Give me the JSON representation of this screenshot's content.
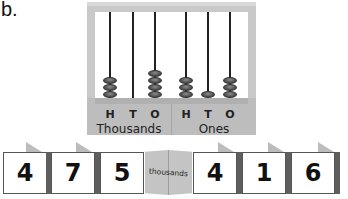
{
  "problem_label": "b.",
  "abacus": {
    "groups": [
      {
        "name": "Thousands",
        "columns": [
          {
            "letter": "H",
            "beads": 3
          },
          {
            "letter": "T",
            "beads": 0
          },
          {
            "letter": "O",
            "beads": 4
          }
        ]
      },
      {
        "name": "Ones",
        "columns": [
          {
            "letter": "H",
            "beads": 3
          },
          {
            "letter": "T",
            "beads": 1
          },
          {
            "letter": "O",
            "beads": 3
          }
        ]
      }
    ]
  },
  "number_cards": {
    "thousands_digits": [
      "4",
      "7",
      "5"
    ],
    "separator_label": "thousands",
    "ones_digits": [
      "4",
      "1",
      "6"
    ]
  },
  "colors": {
    "frame": "#c9c9c9",
    "bead": "#5a5a5a",
    "card_border": "#555555",
    "fold": "#c4c4c4"
  }
}
